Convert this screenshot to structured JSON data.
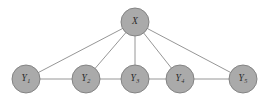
{
  "figure": {
    "kind": "undirected-graphical-model",
    "background_color": "#ffffff",
    "node_fill_color": "#aaaaaa",
    "node_stroke_color": "#7d7d7d",
    "edge_color": "#8a8a8a",
    "label_color": "#2b2b2b",
    "width": 271,
    "height": 100
  },
  "nodes": [
    {
      "id": "X",
      "base": "X",
      "subscript": "",
      "label": "X",
      "cx": 135,
      "cy": 22,
      "r": 14,
      "role": "latent-parent"
    },
    {
      "id": "Y1",
      "base": "Y",
      "subscript": "1",
      "label": "Y1",
      "cx": 26,
      "cy": 79,
      "r": 14,
      "role": "observed"
    },
    {
      "id": "Y2",
      "base": "Y",
      "subscript": "2",
      "label": "Y2",
      "cx": 86,
      "cy": 79,
      "r": 14,
      "role": "observed"
    },
    {
      "id": "Y3",
      "base": "Y",
      "subscript": "3",
      "label": "Y3",
      "cx": 135,
      "cy": 79,
      "r": 14,
      "role": "observed"
    },
    {
      "id": "Y4",
      "base": "Y",
      "subscript": "4",
      "label": "Y4",
      "cx": 180,
      "cy": 79,
      "r": 14,
      "role": "observed"
    },
    {
      "id": "Y5",
      "base": "Y",
      "subscript": "5",
      "label": "Y5",
      "cx": 243,
      "cy": 79,
      "r": 14,
      "role": "observed"
    }
  ],
  "edges": [
    {
      "id": "e-x-y1",
      "source": "X",
      "target": "Y1"
    },
    {
      "id": "e-x-y2",
      "source": "X",
      "target": "Y2"
    },
    {
      "id": "e-x-y3",
      "source": "X",
      "target": "Y3"
    },
    {
      "id": "e-x-y4",
      "source": "X",
      "target": "Y4"
    },
    {
      "id": "e-x-y5",
      "source": "X",
      "target": "Y5"
    },
    {
      "id": "e-y1-y2",
      "source": "Y1",
      "target": "Y2"
    },
    {
      "id": "e-y2-y3",
      "source": "Y2",
      "target": "Y3"
    },
    {
      "id": "e-y3-y4",
      "source": "Y3",
      "target": "Y4"
    },
    {
      "id": "e-y4-y5",
      "source": "Y4",
      "target": "Y5"
    }
  ]
}
